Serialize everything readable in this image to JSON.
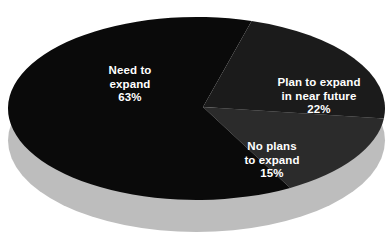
{
  "chart_data": {
    "type": "pie",
    "title": "",
    "subtitle": "",
    "xlabel": "",
    "ylabel": "",
    "legend_position": "none",
    "grid": false,
    "style": "3d-pie",
    "value_unit": "%",
    "categories": [
      "Need to expand",
      "Plan to expand in near future",
      "No plans to expand"
    ],
    "values": [
      63,
      22,
      15
    ],
    "colors": [
      "#0a0a0a",
      "#1b1b1b",
      "#2b2b2b"
    ],
    "background_color": "#ffffff",
    "base_color": "#bdbdbd",
    "label_color": "#ffffff",
    "slices": [
      {
        "name": "Need to expand",
        "value": 63,
        "value_label": "63%",
        "color": "#0a0a0a",
        "label_lines": [
          "Need to",
          "expand",
          "63%"
        ]
      },
      {
        "name": "Plan to expand in near future",
        "value": 22,
        "value_label": "22%",
        "color": "#1b1b1b",
        "label_lines": [
          "Plan to expand",
          "in near future",
          "22%"
        ]
      },
      {
        "name": "No plans to expand",
        "value": 15,
        "value_label": "15%",
        "color": "#2b2b2b",
        "label_lines": [
          "No plans",
          "to expand",
          "15%"
        ]
      }
    ]
  },
  "labels": {
    "need_to_expand": {
      "line1": "Need to",
      "line2": "expand",
      "line3": "63%"
    },
    "plan_to_expand": {
      "line1": "Plan to expand",
      "line2": "in near future",
      "line3": "22%"
    },
    "no_plans": {
      "line1": "No plans",
      "line2": "to expand",
      "line3": "15%"
    }
  }
}
